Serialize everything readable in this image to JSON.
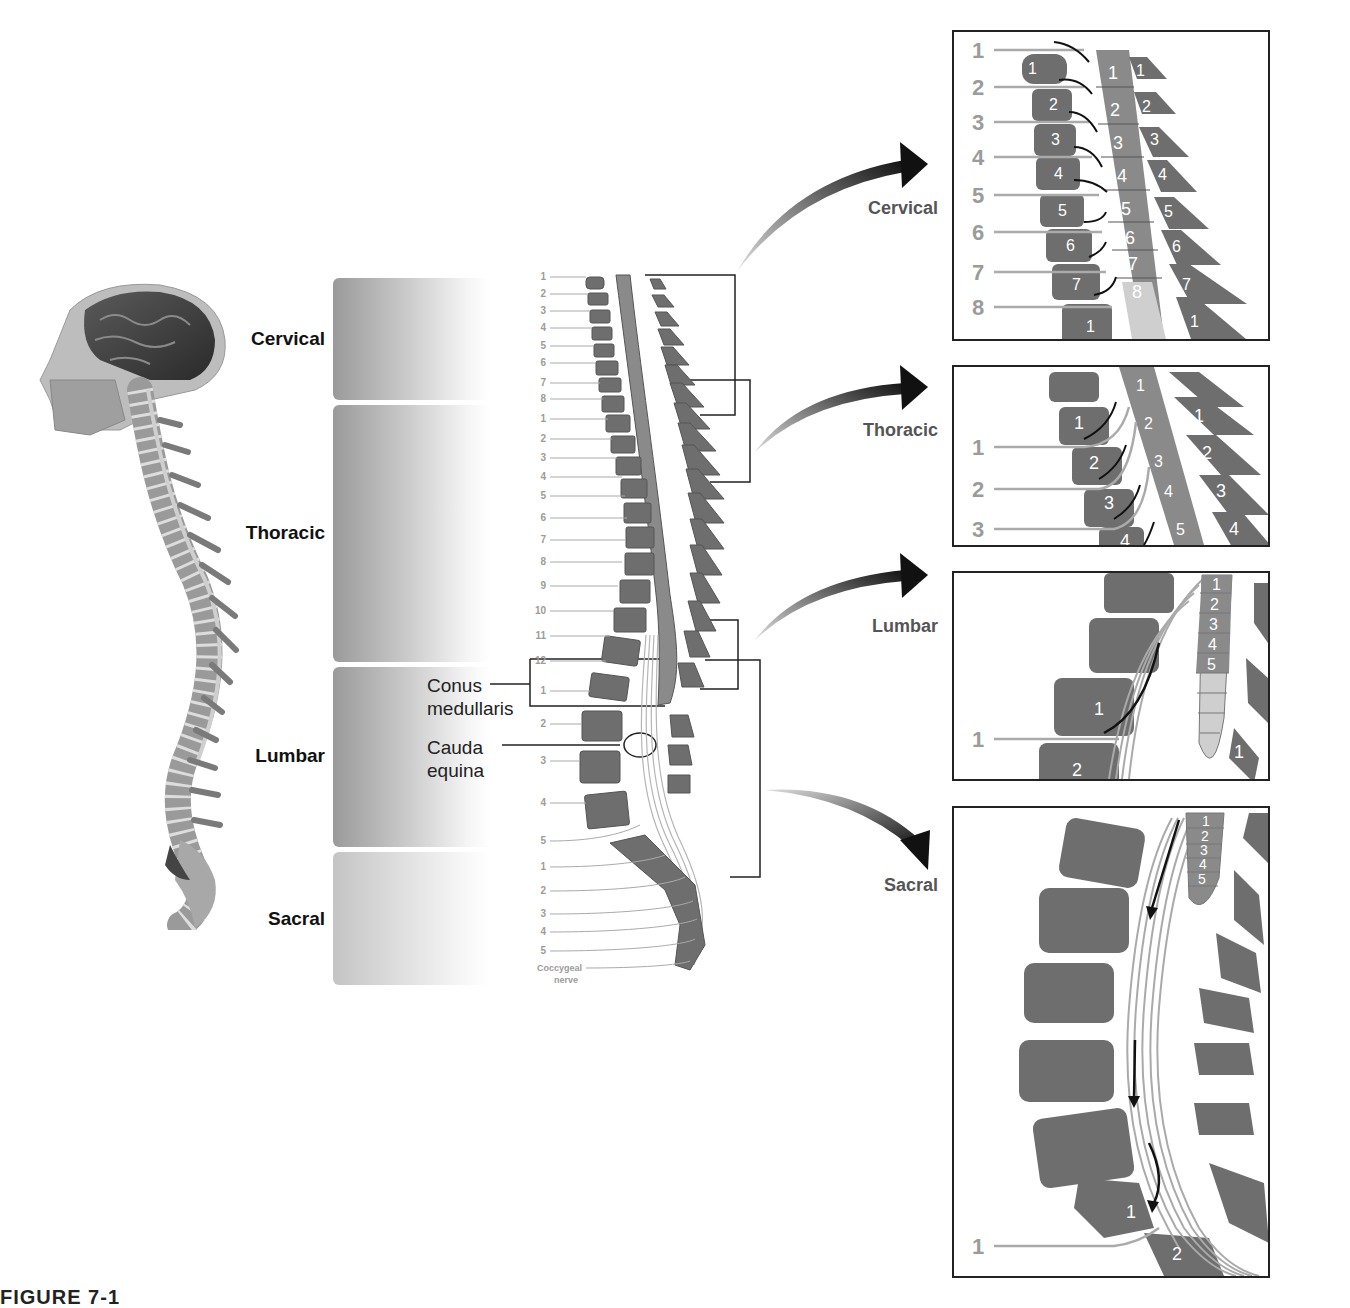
{
  "figure": {
    "caption_partial": "FIGURE 7-1",
    "left_region_labels": [
      "Cervical",
      "Thoracic",
      "Lumbar",
      "Sacral"
    ],
    "annotations": {
      "conus": "Conus\nmedullaris",
      "conus_line1": "Conus",
      "conus_line2": "medullaris",
      "cauda_line1": "Cauda",
      "cauda_line2": "equina"
    },
    "center_diagram": {
      "left_numbers": {
        "cervical": [
          "1",
          "2",
          "3",
          "4",
          "5",
          "6",
          "7",
          "8"
        ],
        "thoracic": [
          "1",
          "2",
          "3",
          "4",
          "5",
          "6",
          "7",
          "8",
          "9",
          "10",
          "11",
          "12"
        ],
        "lumbar": [
          "1",
          "2",
          "3",
          "4",
          "5"
        ],
        "sacral": [
          "1",
          "2",
          "3",
          "4",
          "5"
        ]
      },
      "coccygeal_label_1": "Coccygeal",
      "coccygeal_label_2": "nerve"
    },
    "panels": [
      {
        "name": "Cervical",
        "nerve_numbers": [
          "1",
          "2",
          "3",
          "4",
          "5",
          "6",
          "7",
          "8"
        ],
        "cord_segments": [
          "1",
          "2",
          "3",
          "4",
          "5",
          "6",
          "7",
          "8"
        ],
        "vertebra_numbers": [
          "1",
          "2",
          "3",
          "4",
          "5",
          "6",
          "7",
          "1"
        ]
      },
      {
        "name": "Thoracic",
        "nerve_numbers": [
          "1",
          "2",
          "3"
        ],
        "cord_segments": [
          "1",
          "2",
          "3",
          "4",
          "5"
        ],
        "vertebra_numbers": [
          "1",
          "2",
          "3",
          "4"
        ]
      },
      {
        "name": "Lumbar",
        "nerve_numbers": [
          "1"
        ],
        "cord_segments": [
          "1",
          "2",
          "3",
          "4",
          "5"
        ],
        "vertebra_numbers": [
          "1",
          "2"
        ]
      },
      {
        "name": "Sacral",
        "nerve_numbers": [
          "1"
        ],
        "cord_segments": [
          "1",
          "2",
          "3",
          "4",
          "5"
        ],
        "vertebra_numbers": [
          "1",
          "2"
        ]
      }
    ],
    "colors": {
      "vertebra": "#6e6e6e",
      "cord": "#8a8a8a",
      "cord_light": "#cfcfcf",
      "nerve_line": "#9a9a9a",
      "number_gray": "#9b9b9b",
      "arrow": "#111111"
    }
  }
}
